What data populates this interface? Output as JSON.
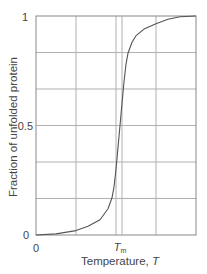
{
  "chart_data": {
    "type": "line",
    "title": "",
    "xlabel": "Temperature, T",
    "ylabel": "Fraction of unfolded protein",
    "xlim": [
      0,
      4
    ],
    "ylim": [
      0,
      1
    ],
    "grid": true,
    "legend": null,
    "x_ticks": [
      {
        "value": 0,
        "label": "0"
      },
      {
        "value": 2.15,
        "label": "T",
        "subscript": "m"
      }
    ],
    "y_ticks": [
      {
        "value": 0,
        "label": "0"
      },
      {
        "value": 0.5,
        "label": "0.5"
      },
      {
        "value": 1,
        "label": "1"
      }
    ],
    "grid_x": [
      1,
      2,
      3
    ],
    "grid_y": [
      0.1667,
      0.3333,
      0.5,
      0.6667,
      0.8333
    ],
    "annotations": [
      {
        "type": "vline",
        "x": 2.15,
        "label": "Tm"
      }
    ],
    "series": [
      {
        "name": "Fraction of unfolded protein",
        "x": [
          0,
          0.5,
          1.0,
          1.3,
          1.6,
          1.8,
          1.9,
          1.95,
          2.0,
          2.05,
          2.1,
          2.15,
          2.2,
          2.25,
          2.3,
          2.4,
          2.5,
          2.7,
          3.0,
          3.3,
          3.6,
          4.0
        ],
        "y": [
          0,
          0.005,
          0.02,
          0.04,
          0.07,
          0.12,
          0.17,
          0.22,
          0.3,
          0.4,
          0.5,
          0.6,
          0.7,
          0.78,
          0.83,
          0.88,
          0.91,
          0.94,
          0.965,
          0.985,
          0.997,
          1.0
        ]
      }
    ]
  },
  "axes": {
    "y_label": "Fraction of unfolded protein",
    "x_label": "Temperature, T",
    "x_label_main": "Temperature, ",
    "x_label_var": "T",
    "tm_label_main": "T",
    "tm_label_sub": "m",
    "y_tick_0": "0",
    "y_tick_05": "0.5",
    "y_tick_1": "1",
    "x_tick_0": "0"
  },
  "colors": {
    "curve": "#555555",
    "grid": "#b0b0b0",
    "axis": "#777777",
    "text": "#444444"
  }
}
